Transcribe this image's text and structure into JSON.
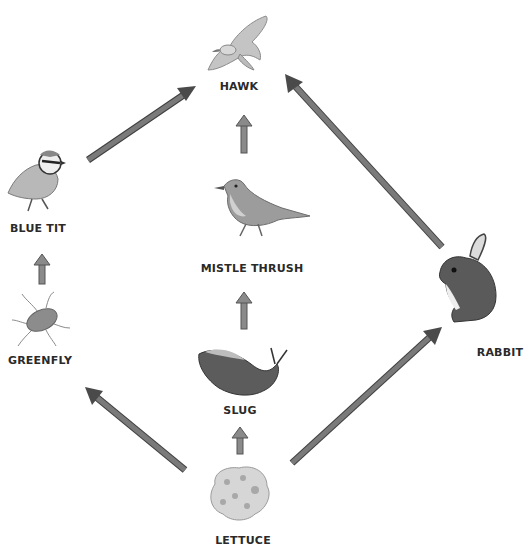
{
  "diagram": {
    "type": "food-web",
    "organisms": [
      {
        "id": "hawk",
        "label": "HAWK",
        "role": "top predator"
      },
      {
        "id": "blue_tit",
        "label": "BLUE TIT",
        "role": "secondary consumer"
      },
      {
        "id": "mistle_thrush",
        "label": "MISTLE THRUSH",
        "role": "secondary consumer"
      },
      {
        "id": "greenfly",
        "label": "GREENFLY",
        "role": "primary consumer"
      },
      {
        "id": "slug",
        "label": "SLUG",
        "role": "primary consumer"
      },
      {
        "id": "rabbit",
        "label": "RABBIT",
        "role": "primary consumer"
      },
      {
        "id": "lettuce",
        "label": "LETTUCE",
        "role": "producer"
      }
    ],
    "arrows": [
      {
        "from": "lettuce",
        "to": "greenfly"
      },
      {
        "from": "lettuce",
        "to": "slug"
      },
      {
        "from": "lettuce",
        "to": "rabbit"
      },
      {
        "from": "greenfly",
        "to": "blue_tit"
      },
      {
        "from": "slug",
        "to": "mistle_thrush"
      },
      {
        "from": "blue_tit",
        "to": "hawk"
      },
      {
        "from": "mistle_thrush",
        "to": "hawk"
      },
      {
        "from": "rabbit",
        "to": "hawk"
      }
    ],
    "colors": {
      "arrow_fill": "#6e6e6e",
      "arrow_dark": "#444444",
      "short_arrow_fill": "#8a8a8a",
      "label": "#2a2a2a",
      "background": "#ffffff"
    }
  }
}
